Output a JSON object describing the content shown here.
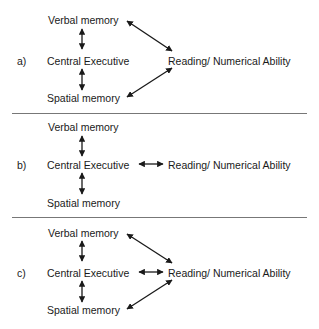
{
  "diagram": {
    "panels": [
      {
        "label": "a)",
        "nodes": {
          "verbal": "Verbal memory",
          "central": "Central Executive",
          "spatial": "Spatial memory",
          "reading": "Reading/ Numerical Ability"
        },
        "edges": [
          "verbal<->central",
          "central<->spatial",
          "verbal<->reading",
          "spatial<->reading"
        ]
      },
      {
        "label": "b)",
        "nodes": {
          "verbal": "Verbal memory",
          "central": "Central Executive",
          "spatial": "Spatial memory",
          "reading": "Reading/ Numerical Ability"
        },
        "edges": [
          "verbal<->central",
          "central<->spatial",
          "central<->reading"
        ]
      },
      {
        "label": "c)",
        "nodes": {
          "verbal": "Verbal memory",
          "central": "Central Executive",
          "spatial": "Spatial memory",
          "reading": "Reading/ Numerical Ability"
        },
        "edges": [
          "verbal<->central",
          "central<->spatial",
          "verbal<->reading",
          "central<->reading",
          "spatial<->reading"
        ]
      }
    ],
    "colors": {
      "text": "#1a1a1a",
      "arrow": "#1a1a1a",
      "separator": "#777777"
    }
  }
}
